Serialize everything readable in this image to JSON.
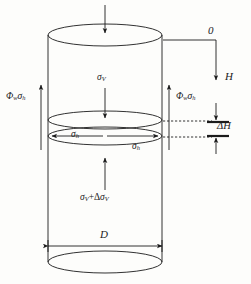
{
  "figure": {
    "kind": "silo-cylinder-stress-diagram",
    "line_color": "#1b1b1b",
    "background": "#fdfdfb"
  },
  "labels": {
    "datum_zero": "0",
    "depth_H": "H",
    "delta_H": "ΔH",
    "diameter_D": "D",
    "wall_friction_left": {
      "phi": "Φ",
      "phi_sub": "w",
      "sigma": "σ",
      "sigma_sub": "h"
    },
    "wall_friction_right": {
      "phi": "Φ",
      "phi_sub": "w",
      "sigma": "σ",
      "sigma_sub": "h"
    },
    "vertical_stress_top": {
      "sigma": "σ",
      "sigma_sub": "V"
    },
    "vertical_stress_bottom": {
      "sigma": "σ",
      "sigma_sub": "V",
      "plus": "+Δ",
      "sigma2": "σ",
      "sigma2_sub": "V"
    },
    "horizontal_stress_left": {
      "sigma": "σ",
      "sigma_sub": "h"
    },
    "horizontal_stress_right": {
      "sigma": "σ",
      "sigma_sub": "h"
    }
  },
  "geometry": {
    "cylinder_left_x": 48,
    "cylinder_right_x": 162,
    "top_ellipse_cy": 35,
    "bottom_ellipse_cy": 262,
    "mid_ellipse_upper_cy": 120,
    "mid_ellipse_lower_cy": 136,
    "ellipse_rx": 57,
    "ellipse_ry": 11
  }
}
